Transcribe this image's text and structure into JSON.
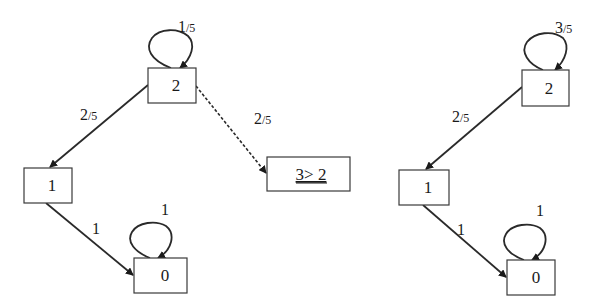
{
  "diagrams": [
    {
      "name": "left-graph",
      "nodes": [
        {
          "id": "2",
          "label": "2"
        },
        {
          "id": "1",
          "label": "1"
        },
        {
          "id": "0",
          "label": "0"
        },
        {
          "id": "3gt2",
          "label": "3> 2",
          "underlined": true
        }
      ],
      "edges": [
        {
          "from": "2",
          "to": "2",
          "num": "1",
          "den": "/5",
          "style": "solid"
        },
        {
          "from": "2",
          "to": "1",
          "num": "2",
          "den": "/5",
          "style": "solid"
        },
        {
          "from": "2",
          "to": "3gt2",
          "num": "2",
          "den": "/5",
          "style": "dashed"
        },
        {
          "from": "1",
          "to": "0",
          "num": "1",
          "den": "",
          "style": "solid"
        },
        {
          "from": "0",
          "to": "0",
          "num": "1",
          "den": "",
          "style": "solid"
        }
      ]
    },
    {
      "name": "right-graph",
      "nodes": [
        {
          "id": "2",
          "label": "2"
        },
        {
          "id": "1",
          "label": "1"
        },
        {
          "id": "0",
          "label": "0"
        }
      ],
      "edges": [
        {
          "from": "2",
          "to": "2",
          "num": "3",
          "den": "/5",
          "style": "solid"
        },
        {
          "from": "2",
          "to": "1",
          "num": "2",
          "den": "/5",
          "style": "solid"
        },
        {
          "from": "1",
          "to": "0",
          "num": "1",
          "den": "",
          "style": "solid"
        },
        {
          "from": "0",
          "to": "0",
          "num": "1",
          "den": "",
          "style": "solid"
        }
      ]
    }
  ]
}
